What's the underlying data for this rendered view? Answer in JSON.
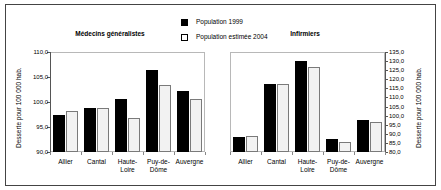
{
  "legend": {
    "entries": [
      {
        "label": "Population 1999",
        "swatch": "filled-square",
        "color": "#000000"
      },
      {
        "label": "Population estimée 2004",
        "swatch": "hollow-square",
        "color": "#ffffff"
      }
    ]
  },
  "chart_data": [
    {
      "type": "bar",
      "title": "Médecins généralistes",
      "xlabel": "",
      "ylabel": "Desserte pour 100 000 hab.",
      "categories": [
        "Allier",
        "Cantal",
        "Haute-\nLoire",
        "Puy-de-\nDôme",
        "Auvergne"
      ],
      "ylim": [
        90.0,
        110.0
      ],
      "yticks": [
        "90,0",
        "95,0",
        "100,0",
        "105,0",
        "110,0"
      ],
      "ytick_values": [
        90.0,
        95.0,
        100.0,
        105.0,
        110.0
      ],
      "grid": false,
      "legend_position": "top-center",
      "series": [
        {
          "name": "Population 1999",
          "values": [
            97.5,
            98.8,
            100.6,
            106.4,
            102.3
          ]
        },
        {
          "name": "Population estimée 2004",
          "values": [
            98.3,
            98.8,
            96.8,
            103.4,
            100.6
          ]
        }
      ]
    },
    {
      "type": "bar",
      "title": "Infirmiers",
      "xlabel": "",
      "ylabel": "Desserte pour 100 000 hab.",
      "categories": [
        "Allier",
        "Cantal",
        "Haute-\nLoire",
        "Puy-de-\nDôme",
        "Auvergne"
      ],
      "ylim": [
        80.0,
        135.0
      ],
      "yticks": [
        "80,0",
        "85,0",
        "90,0",
        "95,0",
        "100,0",
        "105,0",
        "110,0",
        "115,0",
        "120,0",
        "125,0",
        "130,0",
        "135,0"
      ],
      "ytick_values": [
        80.0,
        85.0,
        90.0,
        95.0,
        100.0,
        105.0,
        110.0,
        115.0,
        120.0,
        125.0,
        130.0,
        135.0
      ],
      "grid": false,
      "legend_position": "top-center",
      "series": [
        {
          "name": "Population 1999",
          "values": [
            88.5,
            117.5,
            130.0,
            87.0,
            97.5
          ]
        },
        {
          "name": "Population estimée 2004",
          "values": [
            89.0,
            117.5,
            126.5,
            85.5,
            96.5
          ]
        }
      ]
    }
  ]
}
